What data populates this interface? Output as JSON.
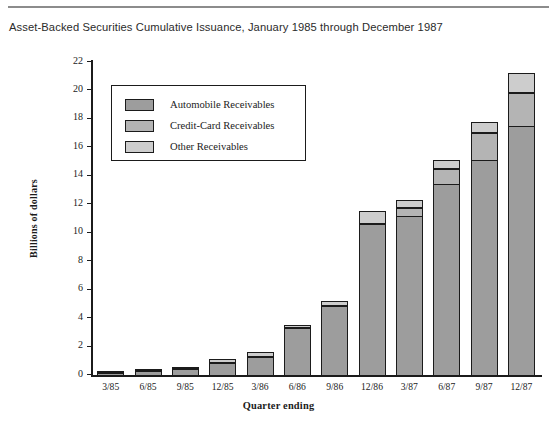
{
  "figure": {
    "title": "Asset-Backed Securities Cumulative Issuance, January 1985 through December 1987"
  },
  "legend": {
    "items": [
      {
        "label": "Automobile Receivables",
        "key": "auto",
        "color": "#9d9d9d"
      },
      {
        "label": "Credit-Card Receivables",
        "key": "card",
        "color": "#b4b4b4"
      },
      {
        "label": "Other Receivables",
        "key": "other",
        "color": "#cdcdcd"
      }
    ]
  },
  "chart_data": {
    "type": "bar",
    "stacked": true,
    "title": "Asset-Backed Securities Cumulative Issuance, January 1985 through December 1987",
    "xlabel": "Quarter ending",
    "ylabel": "Billions of dollars",
    "ylim": [
      0,
      22
    ],
    "yticks": [
      0,
      2,
      4,
      6,
      8,
      10,
      12,
      14,
      16,
      18,
      20,
      22
    ],
    "ytick_labels": [
      "0",
      "2",
      "4",
      "6",
      "8",
      "10",
      "12",
      "14",
      "16",
      "18",
      "20",
      "22"
    ],
    "grid": false,
    "legend_position": "upper-left-inset",
    "categories": [
      "3/85",
      "6/85",
      "9/85",
      "12/85",
      "3/86",
      "6/86",
      "9/86",
      "12/86",
      "3/87",
      "6/87",
      "9/87",
      "12/87"
    ],
    "series": [
      {
        "name": "Automobile Receivables",
        "color": "#9d9d9d",
        "values": [
          0.15,
          0.25,
          0.4,
          0.85,
          1.25,
          3.3,
          4.85,
          10.6,
          11.2,
          13.4,
          15.1,
          17.5
        ]
      },
      {
        "name": "Credit-Card Receivables",
        "color": "#b4b4b4",
        "values": [
          0.0,
          0.0,
          0.0,
          0.0,
          0.0,
          0.0,
          0.0,
          0.0,
          0.55,
          1.1,
          1.9,
          2.3
        ]
      },
      {
        "name": "Other Receivables",
        "color": "#cdcdcd",
        "values": [
          0.05,
          0.1,
          0.15,
          0.3,
          0.35,
          0.25,
          0.35,
          0.9,
          0.55,
          0.6,
          0.8,
          1.4
        ]
      }
    ],
    "totals": [
      0.2,
      0.35,
      0.55,
      1.15,
      1.6,
      3.55,
      5.2,
      11.5,
      12.3,
      15.1,
      17.8,
      21.2
    ]
  }
}
